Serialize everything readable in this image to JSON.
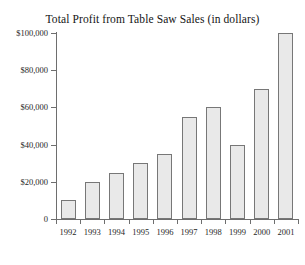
{
  "chart_data": {
    "type": "bar",
    "title": "Total Profit from Table Saw Sales (in dollars)",
    "xlabel": "",
    "ylabel": "",
    "categories": [
      "1992",
      "1993",
      "1994",
      "1995",
      "1996",
      "1997",
      "1998",
      "1999",
      "2000",
      "2001"
    ],
    "values": [
      10000,
      20000,
      25000,
      30000,
      35000,
      55000,
      60000,
      40000,
      70000,
      100000
    ],
    "ylim": [
      0,
      100000
    ],
    "ytick_values": [
      0,
      20000,
      40000,
      60000,
      80000,
      100000
    ],
    "ytick_labels": [
      "0",
      "$20,000",
      "$40,000",
      "$60,000",
      "$80,000",
      "$100,000"
    ],
    "grid": false,
    "legend": "none",
    "bar_fill_color": "#e9e9e9",
    "bar_border_color": "#777777",
    "axis_color": "#6e6e6e",
    "background_color": "#ffffff"
  }
}
